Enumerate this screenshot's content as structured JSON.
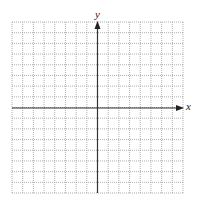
{
  "diagram": {
    "type": "coordinate-grid",
    "x_axis_label": "x",
    "y_axis_label": "y",
    "grid": {
      "cells_left": 8,
      "cells_right": 8,
      "cells_up": 8,
      "cells_down": 8,
      "line_style": "dotted",
      "line_color": "#9a9a9a",
      "axis_color": "#333333"
    }
  }
}
